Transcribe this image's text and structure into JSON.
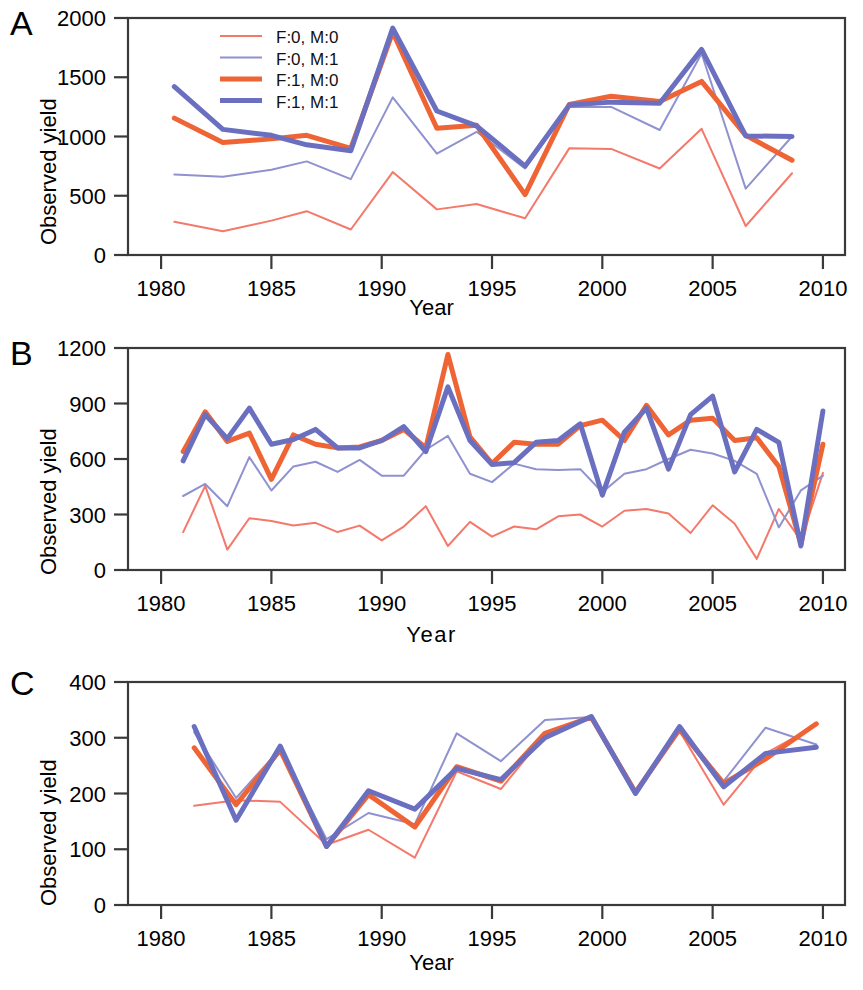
{
  "figure": {
    "panels": [
      {
        "letter": "A",
        "ylabel": "Observed yield",
        "xlabel": "Year",
        "xlabel_spaced": false
      },
      {
        "letter": "B",
        "ylabel": "Observed yield",
        "xlabel": "Year",
        "xlabel_spaced": true
      },
      {
        "letter": "C",
        "ylabel": "Observed yield",
        "xlabel": "Year",
        "xlabel_spaced": false
      }
    ]
  },
  "legend": {
    "position": "top-left-inside-panel-A",
    "entries": [
      {
        "label": "F:0, M:0",
        "color": "#f4796b",
        "width": 2.0
      },
      {
        "label": "F:0, M:1",
        "color": "#8f92cf",
        "width": 2.0
      },
      {
        "label": "F:1, M:0",
        "color": "#ef6434",
        "width": 5.0
      },
      {
        "label": "F:1, M:1",
        "color": "#6b6fc0",
        "width": 5.0
      }
    ]
  },
  "colors": {
    "f0m0": "#f4796b",
    "f0m1": "#8f92cf",
    "f1m0": "#ef6434",
    "f1m1": "#6b6fc0",
    "axis": "#3a3a3a",
    "text": "#000000",
    "background": "#ffffff"
  },
  "chart_data": [
    {
      "type": "line",
      "panel": "A",
      "title": "",
      "xlabel": "Year",
      "ylabel": "Observed yield",
      "xlim": [
        1978.5,
        2011.0
      ],
      "ylim": [
        0,
        2000
      ],
      "xticks": [
        1980,
        1985,
        1990,
        1995,
        2000,
        2005,
        2010
      ],
      "yticks": [
        0,
        500,
        1000,
        1500,
        2000
      ],
      "grid": false,
      "legend_position": "upper left",
      "x": [
        1980.6,
        1982.8,
        1985.0,
        1986.6,
        1988.6,
        1990.5,
        1992.5,
        1994.3,
        1996.5,
        1998.5,
        2000.4,
        2002.6,
        2004.5,
        2006.5,
        2008.6
      ],
      "series": [
        {
          "name": "F:0, M:0",
          "values": [
            280,
            200,
            290,
            370,
            215,
            700,
            385,
            430,
            310,
            900,
            895,
            730,
            1065,
            245,
            690
          ]
        },
        {
          "name": "F:0, M:1",
          "values": [
            680,
            660,
            720,
            790,
            640,
            1330,
            855,
            1040,
            730,
            1250,
            1250,
            1055,
            1700,
            560,
            1000
          ]
        },
        {
          "name": "F:1, M:0",
          "values": [
            1155,
            950,
            980,
            1010,
            900,
            1880,
            1070,
            1095,
            510,
            1270,
            1340,
            1295,
            1465,
            1010,
            800
          ]
        },
        {
          "name": "F:1, M:1",
          "values": [
            1420,
            1060,
            1010,
            930,
            880,
            1915,
            1215,
            1090,
            750,
            1265,
            1290,
            1280,
            1735,
            1005,
            1000
          ]
        }
      ]
    },
    {
      "type": "line",
      "panel": "B",
      "title": "",
      "xlabel": "Year",
      "ylabel": "Observed yield",
      "xlim": [
        1978.5,
        2011.0
      ],
      "ylim": [
        0,
        1200
      ],
      "xticks": [
        1980,
        1985,
        1990,
        1995,
        2000,
        2005,
        2010
      ],
      "yticks": [
        0,
        300,
        600,
        900,
        1200
      ],
      "grid": false,
      "legend_position": "none",
      "x": [
        1981,
        1982,
        1983,
        1984,
        1985,
        1986,
        1987,
        1988,
        1989,
        1990,
        1991,
        1992,
        1993,
        1994,
        1995,
        1996,
        1997,
        1998,
        1999,
        2000,
        2001,
        2002,
        2003,
        2004,
        2005,
        2006,
        2007,
        2008,
        2009,
        2010
      ],
      "series": [
        {
          "name": "F:0, M:0",
          "values": [
            205,
            455,
            110,
            280,
            265,
            240,
            255,
            205,
            240,
            160,
            235,
            345,
            130,
            260,
            180,
            235,
            220,
            290,
            300,
            235,
            320,
            330,
            305,
            200,
            350,
            250,
            60,
            330,
            160,
            525
          ]
        },
        {
          "name": "F:0, M:1",
          "values": [
            400,
            465,
            345,
            610,
            430,
            560,
            585,
            530,
            595,
            510,
            510,
            650,
            725,
            520,
            475,
            575,
            545,
            540,
            545,
            420,
            520,
            545,
            600,
            650,
            630,
            590,
            520,
            230,
            430,
            510
          ]
        },
        {
          "name": "F:1, M:0",
          "values": [
            640,
            855,
            695,
            740,
            490,
            730,
            680,
            660,
            665,
            700,
            760,
            660,
            1165,
            720,
            575,
            690,
            680,
            680,
            780,
            810,
            700,
            890,
            730,
            810,
            820,
            700,
            715,
            560,
            140,
            680
          ]
        },
        {
          "name": "F:1, M:1",
          "values": [
            590,
            840,
            710,
            875,
            680,
            705,
            760,
            660,
            660,
            700,
            775,
            640,
            990,
            700,
            570,
            580,
            690,
            700,
            790,
            405,
            745,
            875,
            545,
            840,
            940,
            530,
            760,
            690,
            130,
            860
          ]
        }
      ]
    },
    {
      "type": "line",
      "panel": "C",
      "title": "",
      "xlabel": "Year",
      "ylabel": "Observed yield",
      "xlim": [
        1978.5,
        2011.0
      ],
      "ylim": [
        0,
        400
      ],
      "xticks": [
        1980,
        1985,
        1990,
        1995,
        2000,
        2005,
        2010
      ],
      "yticks": [
        0,
        100,
        200,
        300,
        400
      ],
      "grid": false,
      "legend_position": "none",
      "x": [
        1981.5,
        1983.4,
        1985.4,
        1987.5,
        1989.4,
        1991.5,
        1993.4,
        1995.4,
        1997.4,
        1999.5,
        2001.5,
        2003.5,
        2005.5,
        2007.4,
        2009.7
      ],
      "series": [
        {
          "name": "F:0, M:0",
          "values": [
            178,
            188,
            185,
            108,
            135,
            85,
            240,
            208,
            305,
            338,
            205,
            312,
            180,
            272,
            322
          ]
        },
        {
          "name": "F:0, M:1",
          "values": [
            310,
            192,
            280,
            118,
            165,
            145,
            308,
            258,
            332,
            337,
            205,
            318,
            222,
            318,
            288
          ]
        },
        {
          "name": "F:1, M:0",
          "values": [
            282,
            180,
            278,
            105,
            198,
            140,
            248,
            222,
            308,
            337,
            202,
            315,
            218,
            262,
            325
          ]
        },
        {
          "name": "F:1, M:1",
          "values": [
            320,
            152,
            285,
            105,
            205,
            172,
            245,
            225,
            300,
            338,
            200,
            320,
            212,
            272,
            283
          ]
        }
      ]
    }
  ]
}
